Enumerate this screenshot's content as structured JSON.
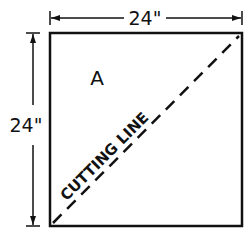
{
  "diagram": {
    "type": "cutting-diagram",
    "colors": {
      "ink": "#111111",
      "background": "#ffffff"
    },
    "square": {
      "label": "A"
    },
    "dimensions": {
      "width_label": "24\"",
      "height_label": "24\""
    },
    "cutting_line": {
      "label": "CUTTING LINE",
      "style": "dashed",
      "from": "bottom-left",
      "to": "top-right"
    }
  }
}
